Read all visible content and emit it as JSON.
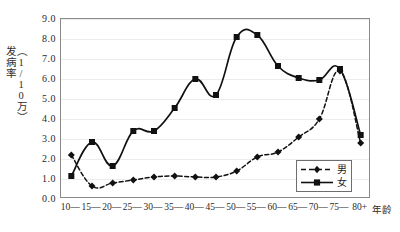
{
  "chart_data": {
    "type": "line",
    "title": "",
    "xlabel": "年龄",
    "ylabel": "发病率（1/10万）",
    "ylabel_parts": [
      "发病率",
      "（1/10万）"
    ],
    "categories": [
      "10—",
      "15—",
      "20—",
      "25—",
      "30—",
      "35—",
      "40—",
      "45—",
      "50—",
      "55—",
      "60—",
      "65—",
      "70—",
      "75—",
      "80+"
    ],
    "ylim": [
      0.0,
      9.0
    ],
    "ytick_labels": [
      "0.0",
      "1.0",
      "2.0",
      "3.0",
      "4.0",
      "5.0",
      "6.0",
      "7.0",
      "8.0",
      "9.0"
    ],
    "ytick_values": [
      0.0,
      1.0,
      2.0,
      3.0,
      4.0,
      5.0,
      6.0,
      7.0,
      8.0,
      9.0
    ],
    "grid": true,
    "legend_position": "bottom-right",
    "series": [
      {
        "name": "男",
        "marker": "diamond",
        "line_style": "dashed",
        "color": "#111111",
        "values": [
          2.2,
          0.65,
          0.8,
          0.95,
          1.1,
          1.15,
          1.1,
          1.1,
          1.4,
          2.1,
          2.35,
          3.1,
          4.0,
          6.4,
          2.8
        ]
      },
      {
        "name": "女",
        "marker": "square",
        "line_style": "solid",
        "color": "#111111",
        "values": [
          1.15,
          2.85,
          1.65,
          3.4,
          3.4,
          4.55,
          6.0,
          5.2,
          8.1,
          8.2,
          6.65,
          6.05,
          5.95,
          6.5,
          3.2
        ]
      }
    ]
  },
  "legend": {
    "items": [
      {
        "label": "男"
      },
      {
        "label": "女"
      }
    ]
  },
  "axes": {
    "x_axis_title": "年龄",
    "y_axis_title_main": "发病率",
    "y_axis_title_unit": "（1/10万）"
  },
  "colors": {
    "series_color": "#111111",
    "grid_color": "#ececec",
    "frame_color": "#8a8a8a",
    "text_color": "#2b2b2b",
    "background": "#ffffff"
  }
}
